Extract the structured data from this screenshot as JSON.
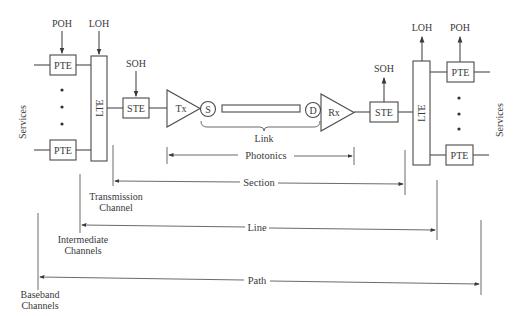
{
  "diagram": {
    "left": {
      "services_label": "Services",
      "poh_label": "POH",
      "loh_label": "LOH",
      "soh_label": "SOH",
      "pte_top": "PTE",
      "pte_bottom": "PTE",
      "lte": "LTE",
      "ste": "STE"
    },
    "center": {
      "tx": "Tx",
      "rx": "Rx",
      "source": "S",
      "detector": "D",
      "link_label": "Link"
    },
    "right": {
      "services_label": "Services",
      "poh_label": "POH",
      "loh_label": "LOH",
      "soh_label": "SOH",
      "pte_top": "PTE",
      "pte_bottom": "PTE",
      "lte": "LTE",
      "ste": "STE"
    },
    "spans": [
      {
        "label": "Photonics",
        "y": 155
      },
      {
        "label": "Section",
        "y": 183
      },
      {
        "label": "Line",
        "y": 228
      },
      {
        "label": "Path",
        "y": 281
      }
    ],
    "channel_labels": {
      "transmission": [
        "Transmission",
        "Channel"
      ],
      "intermediate": [
        "Intermediate",
        "Channels"
      ],
      "baseband": [
        "Baseband",
        "Channels"
      ]
    },
    "colors": {
      "ink": "#4a4a4a",
      "background": "#ffffff"
    }
  }
}
